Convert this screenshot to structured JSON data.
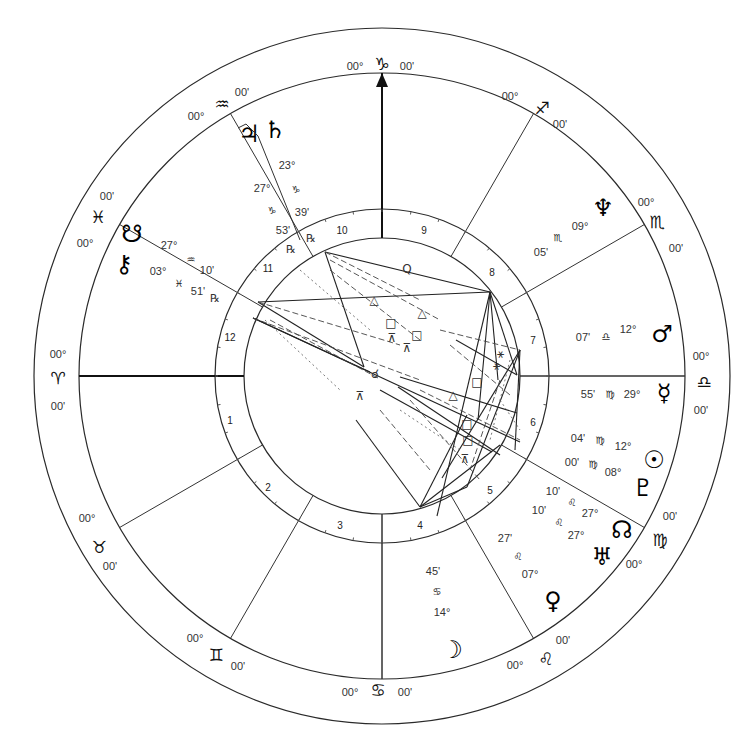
{
  "chart_data": {
    "type": "natal-chart-wheel",
    "center": [
      382,
      376
    ],
    "radii": {
      "outer": 348,
      "zodiac_inner": 303,
      "house_outer": 167,
      "house_inner": 138
    },
    "signs": [
      {
        "name": "Capricorn",
        "glyph": "♑",
        "deg": "00°",
        "min": "00'",
        "pos": [
          382,
          64
        ],
        "deg_pos": [
          355,
          66
        ],
        "min_pos": [
          407,
          66
        ]
      },
      {
        "name": "Sagittarius",
        "glyph": "♐",
        "deg": "00°",
        "min": "00'",
        "pos": [
          542,
          108
        ],
        "deg_pos": [
          510,
          96
        ],
        "min_pos": [
          560,
          124
        ]
      },
      {
        "name": "Scorpio",
        "glyph": "♏",
        "deg": "00°",
        "min": "00'",
        "pos": [
          657,
          222
        ],
        "deg_pos": [
          646,
          202
        ],
        "min_pos": [
          676,
          248
        ]
      },
      {
        "name": "Libra",
        "glyph": "♎",
        "deg": "00°",
        "min": "00'",
        "pos": [
          704,
          382
        ],
        "deg_pos": [
          701,
          356
        ],
        "min_pos": [
          701,
          410
        ]
      },
      {
        "name": "Virgo",
        "glyph": "♍",
        "deg": "00°",
        "min": "00'",
        "pos": [
          660,
          540
        ],
        "deg_pos": [
          634,
          564
        ],
        "min_pos": [
          670,
          516
        ]
      },
      {
        "name": "Leo",
        "glyph": "♌",
        "deg": "00°",
        "min": "00'",
        "pos": [
          546,
          659
        ],
        "deg_pos": [
          515,
          665
        ],
        "min_pos": [
          563,
          640
        ]
      },
      {
        "name": "Cancer",
        "glyph": "♋",
        "deg": "00°",
        "min": "00'",
        "pos": [
          378,
          690
        ],
        "deg_pos": [
          350,
          692
        ],
        "min_pos": [
          405,
          692
        ]
      },
      {
        "name": "Gemini",
        "glyph": "♊",
        "deg": "00°",
        "min": "00'",
        "pos": [
          216,
          655
        ],
        "deg_pos": [
          195,
          638
        ],
        "min_pos": [
          238,
          666
        ]
      },
      {
        "name": "Taurus",
        "glyph": "♉",
        "deg": "00°",
        "min": "00'",
        "pos": [
          99,
          547
        ],
        "deg_pos": [
          87,
          518
        ],
        "min_pos": [
          110,
          566
        ]
      },
      {
        "name": "Aries",
        "glyph": "♈",
        "deg": "00°",
        "min": "00'",
        "pos": [
          58,
          378
        ],
        "deg_pos": [
          58,
          354
        ],
        "min_pos": [
          58,
          406
        ]
      },
      {
        "name": "Pisces",
        "glyph": "♓",
        "deg": "00°",
        "min": "00'",
        "pos": [
          98,
          217
        ],
        "deg_pos": [
          85,
          243
        ],
        "min_pos": [
          107,
          196
        ]
      },
      {
        "name": "Aquarius",
        "glyph": "♒",
        "deg": "00°",
        "min": "00'",
        "pos": [
          222,
          104
        ],
        "deg_pos": [
          196,
          116
        ],
        "min_pos": [
          242,
          92
        ]
      }
    ],
    "house_numbers": [
      {
        "n": "10",
        "pos": [
          342,
          230
        ]
      },
      {
        "n": "9",
        "pos": [
          424,
          230
        ]
      },
      {
        "n": "8",
        "pos": [
          492,
          272
        ]
      },
      {
        "n": "7",
        "pos": [
          533,
          340
        ]
      },
      {
        "n": "6",
        "pos": [
          533,
          422
        ]
      },
      {
        "n": "5",
        "pos": [
          490,
          490
        ]
      },
      {
        "n": "4",
        "pos": [
          420,
          525
        ]
      },
      {
        "n": "3",
        "pos": [
          340,
          525
        ]
      },
      {
        "n": "2",
        "pos": [
          268,
          487
        ]
      },
      {
        "n": "1",
        "pos": [
          230,
          420
        ]
      },
      {
        "n": "12",
        "pos": [
          230,
          337
        ]
      },
      {
        "n": "11",
        "pos": [
          268,
          268
        ]
      }
    ],
    "cusp_angles_deg": [
      90,
      60,
      30,
      0,
      -30,
      -60,
      -90,
      -120,
      -150,
      180,
      150,
      120
    ],
    "planets": [
      {
        "name": "Jupiter",
        "glyph": "♃",
        "pos": [
          249,
          134
        ],
        "deg": "27°",
        "sign": "♑",
        "min": "53'",
        "retro": "℞",
        "deg_pos": [
          262,
          188
        ],
        "sign_pos": [
          272,
          210
        ],
        "min_pos": [
          283,
          230
        ],
        "retro_pos": [
          291,
          249
        ]
      },
      {
        "name": "Saturn",
        "glyph": "♄",
        "pos": [
          275,
          130
        ],
        "deg": "23°",
        "sign": "♑",
        "min": "39'",
        "retro": "℞",
        "deg_pos": [
          287,
          165
        ],
        "sign_pos": [
          296,
          189
        ],
        "min_pos": [
          302,
          212
        ],
        "retro_pos": [
          311,
          238
        ]
      },
      {
        "name": "South Node",
        "glyph": "☋",
        "pos": [
          132,
          234
        ],
        "deg": "27°",
        "sign": "♒",
        "min": "10'",
        "deg_pos": [
          169,
          245
        ],
        "sign_pos": [
          191,
          259
        ],
        "min_pos": [
          207,
          270
        ]
      },
      {
        "name": "Chiron",
        "glyph": "⚷",
        "pos": [
          124,
          264
        ],
        "deg": "03°",
        "sign": "♓",
        "min": "51'",
        "retro": "℞",
        "deg_pos": [
          158,
          271
        ],
        "sign_pos": [
          179,
          283
        ],
        "min_pos": [
          198,
          291
        ],
        "retro_pos": [
          215,
          298
        ]
      },
      {
        "name": "Neptune",
        "glyph": "♆",
        "pos": [
          603,
          208
        ],
        "deg": "09°",
        "sign": "♏",
        "min": "05'",
        "deg_pos": [
          580,
          226
        ],
        "sign_pos": [
          558,
          237
        ],
        "min_pos": [
          541,
          252
        ]
      },
      {
        "name": "Mars",
        "glyph": "♂",
        "pos": [
          662,
          334
        ],
        "deg": "12°",
        "sign": "♎",
        "min": "07'",
        "deg_pos": [
          628,
          329
        ],
        "sign_pos": [
          606,
          336
        ],
        "min_pos": [
          583,
          337
        ]
      },
      {
        "name": "Mercury",
        "glyph": "☿",
        "pos": [
          664,
          393
        ],
        "deg": "29°",
        "sign": "♍",
        "min": "55'",
        "deg_pos": [
          632,
          394
        ],
        "sign_pos": [
          610,
          394
        ],
        "min_pos": [
          588,
          394
        ]
      },
      {
        "name": "Sun",
        "glyph": "☉",
        "pos": [
          654,
          460
        ],
        "deg": "12°",
        "sign": "♍",
        "min": "04'",
        "deg_pos": [
          623,
          446
        ],
        "sign_pos": [
          600,
          440
        ],
        "min_pos": [
          578,
          438
        ]
      },
      {
        "name": "Pluto",
        "glyph": "♇",
        "pos": [
          643,
          488
        ],
        "deg": "08°",
        "sign": "♍",
        "min": "00'",
        "deg_pos": [
          613,
          472
        ],
        "sign_pos": [
          593,
          464
        ],
        "min_pos": [
          572,
          462
        ]
      },
      {
        "name": "North Node",
        "glyph": "☊",
        "pos": [
          622,
          530
        ],
        "deg": "27°",
        "sign": "♌",
        "min": "10'",
        "deg_pos": [
          590,
          513
        ],
        "sign_pos": [
          572,
          502
        ],
        "min_pos": [
          553,
          491
        ]
      },
      {
        "name": "Uranus",
        "glyph": "♅",
        "pos": [
          602,
          557
        ],
        "deg": "27°",
        "sign": "♌",
        "min": "10'",
        "deg_pos": [
          576,
          535
        ],
        "sign_pos": [
          559,
          522
        ],
        "min_pos": [
          539,
          510
        ]
      },
      {
        "name": "Venus",
        "glyph": "♀",
        "pos": [
          553,
          601
        ],
        "deg": "07°",
        "sign": "♌",
        "min": "27'",
        "deg_pos": [
          530,
          574
        ],
        "sign_pos": [
          518,
          556
        ],
        "min_pos": [
          505,
          538
        ]
      },
      {
        "name": "Moon",
        "glyph": "☽",
        "pos": [
          452,
          650
        ],
        "deg": "14°",
        "sign": "♋",
        "min": "45'",
        "deg_pos": [
          442,
          612
        ],
        "sign_pos": [
          437,
          591
        ],
        "min_pos": [
          433,
          571
        ]
      }
    ],
    "axis_labels": {
      "mc_arrow": true,
      "asc_line": true
    },
    "aspect_glyphs": [
      {
        "glyph": "Q",
        "pos": [
          407,
          273
        ]
      },
      {
        "glyph": "△",
        "pos": [
          374,
          304
        ]
      },
      {
        "glyph": "△",
        "pos": [
          422,
          317
        ]
      },
      {
        "glyph": "□",
        "pos": [
          391,
          327
        ]
      },
      {
        "glyph": "□",
        "pos": [
          417,
          339
        ]
      },
      {
        "glyph": "⊼",
        "pos": [
          392,
          342
        ]
      },
      {
        "glyph": "⊼",
        "pos": [
          407,
          352
        ]
      },
      {
        "glyph": "⚹",
        "pos": [
          500,
          358
        ]
      },
      {
        "glyph": "⚹",
        "pos": [
          496,
          370
        ]
      },
      {
        "glyph": "□",
        "pos": [
          477,
          386
        ]
      },
      {
        "glyph": "△",
        "pos": [
          453,
          399
        ]
      },
      {
        "glyph": "□",
        "pos": [
          467,
          428
        ]
      },
      {
        "glyph": "□",
        "pos": [
          468,
          444
        ]
      },
      {
        "glyph": "⊼",
        "pos": [
          465,
          463
        ]
      },
      {
        "glyph": "⊼",
        "pos": [
          360,
          400
        ]
      },
      {
        "glyph": "☌",
        "pos": [
          375,
          378
        ]
      }
    ],
    "aspect_lines_solid": [
      [
        [
          325,
          252
        ],
        [
          490,
          292
        ]
      ],
      [
        [
          325,
          252
        ],
        [
          364,
          367
        ]
      ],
      [
        [
          258,
          302
        ],
        [
          364,
          367
        ]
      ],
      [
        [
          258,
          302
        ],
        [
          490,
          292
        ]
      ],
      [
        [
          253,
          318
        ],
        [
          370,
          372
        ]
      ],
      [
        [
          253,
          318
        ],
        [
          520,
          442
        ]
      ],
      [
        [
          490,
          292
        ],
        [
          437,
          516
        ]
      ],
      [
        [
          490,
          292
        ],
        [
          478,
          420
        ]
      ],
      [
        [
          490,
          292
        ],
        [
          498,
          380
        ]
      ],
      [
        [
          490,
          292
        ],
        [
          517,
          375
        ]
      ],
      [
        [
          420,
          507
        ],
        [
          356,
          420
        ]
      ],
      [
        [
          420,
          507
        ],
        [
          467,
          415
        ]
      ],
      [
        [
          420,
          507
        ],
        [
          500,
          445
        ]
      ],
      [
        [
          420,
          507
        ],
        [
          467,
          487
        ]
      ],
      [
        [
          400,
          377
        ],
        [
          517,
          413
        ]
      ],
      [
        [
          398,
          387
        ],
        [
          500,
          455
        ]
      ],
      [
        [
          380,
          390
        ],
        [
          492,
          452
        ]
      ],
      [
        [
          520,
          350
        ],
        [
          442,
          478
        ]
      ],
      [
        [
          520,
          350
        ],
        [
          467,
          487
        ]
      ],
      [
        [
          520,
          350
        ],
        [
          515,
          450
        ]
      ],
      [
        [
          517,
          375
        ],
        [
          456,
          340
        ]
      ]
    ],
    "aspect_lines_dashed": [
      [
        [
          325,
          252
        ],
        [
          420,
          300
        ]
      ],
      [
        [
          330,
          260
        ],
        [
          440,
          320
        ]
      ],
      [
        [
          258,
          302
        ],
        [
          400,
          345
        ]
      ],
      [
        [
          253,
          318
        ],
        [
          420,
          380
        ]
      ],
      [
        [
          270,
          320
        ],
        [
          378,
          378
        ]
      ],
      [
        [
          330,
          270
        ],
        [
          420,
          340
        ]
      ],
      [
        [
          440,
          330
        ],
        [
          520,
          350
        ]
      ],
      [
        [
          450,
          345
        ],
        [
          510,
          395
        ]
      ],
      [
        [
          410,
          400
        ],
        [
          480,
          480
        ]
      ],
      [
        [
          420,
          390
        ],
        [
          520,
          440
        ]
      ],
      [
        [
          380,
          410
        ],
        [
          430,
          470
        ]
      ],
      [
        [
          500,
          380
        ],
        [
          470,
          470
        ]
      ]
    ],
    "aspect_lines_dotted": [
      [
        [
          265,
          320
        ],
        [
          340,
          390
        ]
      ],
      [
        [
          300,
          270
        ],
        [
          370,
          330
        ]
      ],
      [
        [
          510,
          360
        ],
        [
          490,
          440
        ]
      ],
      [
        [
          500,
          400
        ],
        [
          520,
          430
        ]
      ],
      [
        [
          400,
          410
        ],
        [
          460,
          450
        ]
      ]
    ]
  }
}
